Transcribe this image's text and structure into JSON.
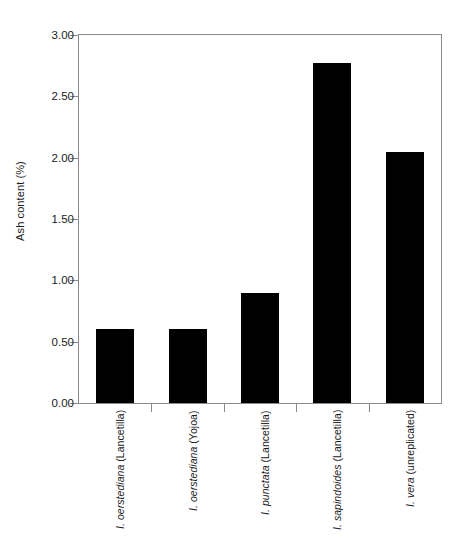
{
  "chart_data": {
    "type": "bar",
    "title": "",
    "xlabel": "",
    "ylabel": "Ash content (%)",
    "categories": [
      "I. oerstediana (Lancetilla)",
      "I. oerstediana (Yojoa)",
      "I. punctata (Lancetilla)",
      "I. sapindoides (Lancetilla)",
      "I. vera (unreplicated)"
    ],
    "category_parts": [
      {
        "species": "I. oerstediana",
        "site": " (Lancetilla)"
      },
      {
        "species": "I. oerstediana",
        "site": " (Yojoa)"
      },
      {
        "species": "I. punctata",
        "site": " (Lancetilla)"
      },
      {
        "species": "I. sapindoides",
        "site": " (Lancetilla)"
      },
      {
        "species": "I. vera",
        "site": " (unreplicated)"
      }
    ],
    "values": [
      0.6,
      0.6,
      0.9,
      2.77,
      2.05
    ],
    "ylim": [
      0.0,
      3.0
    ],
    "ytick_values": [
      0.0,
      0.5,
      1.0,
      1.5,
      2.0,
      2.5,
      3.0
    ],
    "ytick_labels": [
      "0.00",
      "0.50",
      "1.00",
      "1.50",
      "2.00",
      "2.50",
      "3.00"
    ],
    "grid": false,
    "legend": null,
    "bar_color": "#000000",
    "axis_color": "#8a8a8a"
  }
}
